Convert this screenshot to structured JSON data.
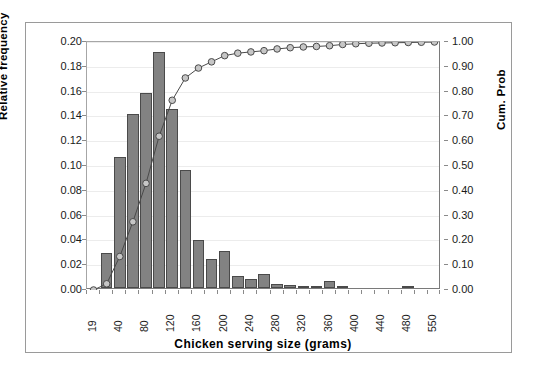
{
  "chart_data": {
    "type": "bar",
    "title": "",
    "xlabel": "Chicken serving size (grams)",
    "ylabel": "Relative frequency",
    "y2label": "Cum. Prob",
    "ylim": [
      0,
      0.2
    ],
    "y2lim": [
      0,
      1.0
    ],
    "grid": true,
    "legend": "none",
    "yticks": [
      "0.20",
      "0.18",
      "0.16",
      "0.14",
      "0.12",
      "0.10",
      "0.08",
      "0.06",
      "0.04",
      "0.02",
      "0.00"
    ],
    "ytick_values": [
      0.2,
      0.18,
      0.16,
      0.14,
      0.12,
      0.1,
      0.08,
      0.06,
      0.04,
      0.02,
      0.0
    ],
    "y2ticks": [
      "1.00",
      "0.90",
      "0.80",
      "0.70",
      "0.60",
      "0.50",
      "0.40",
      "0.30",
      "0.20",
      "0.10",
      "0.00"
    ],
    "y2tick_values": [
      1.0,
      0.9,
      0.8,
      0.7,
      0.6,
      0.5,
      0.4,
      0.3,
      0.2,
      0.1,
      0.0
    ],
    "categories": [
      "19",
      "",
      "40",
      "",
      "80",
      "",
      "120",
      "",
      "160",
      "",
      "200",
      "",
      "240",
      "",
      "280",
      "",
      "320",
      "",
      "360",
      "",
      "400",
      "",
      "440",
      "",
      "480",
      "",
      "550"
    ],
    "xtick_labels": [
      "19",
      "40",
      "80",
      "120",
      "160",
      "200",
      "240",
      "280",
      "320",
      "360",
      "400",
      "440",
      "480",
      "550"
    ],
    "series": [
      {
        "name": "Relative frequency",
        "kind": "bar",
        "axis": "left",
        "color": "#828282",
        "edge_color": "#4a4a4a",
        "values": [
          0.0,
          0.028,
          0.106,
          0.14,
          0.157,
          0.19,
          0.144,
          0.095,
          0.039,
          0.023,
          0.03,
          0.0095,
          0.007,
          0.0115,
          0.003,
          0.0025,
          0.0005,
          0.0008,
          0.006,
          0.0012,
          0.0,
          0.0,
          0.0,
          0.0,
          0.0008,
          0.0,
          0.0
        ]
      },
      {
        "name": "Cum. Prob",
        "kind": "line",
        "axis": "right",
        "color": "#4a4a4a",
        "marker": "circle",
        "marker_fill": "#c6c6c6",
        "values": [
          0.0,
          0.025,
          0.135,
          0.275,
          0.43,
          0.62,
          0.765,
          0.855,
          0.895,
          0.92,
          0.945,
          0.955,
          0.96,
          0.965,
          0.972,
          0.977,
          0.98,
          0.982,
          0.985,
          0.99,
          0.993,
          0.995,
          0.996,
          0.997,
          0.998,
          0.999,
          1.0
        ]
      }
    ]
  },
  "figure": {
    "axis_title_left": "Relative frequency",
    "axis_title_right": "Cum. Prob",
    "axis_title_bottom": "Chicken serving size (grams)"
  }
}
